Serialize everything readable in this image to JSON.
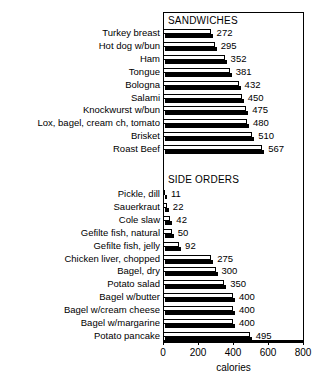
{
  "chart_data": {
    "type": "bar",
    "orientation": "horizontal",
    "title": "",
    "xlabel": "calories",
    "ylabel": "",
    "xlim": [
      0,
      800
    ],
    "xticks": [
      0,
      200,
      400,
      600,
      800
    ],
    "grid": false,
    "legend": null,
    "groups": [
      {
        "name": "SANDWICHES",
        "categories": [
          "Turkey breast",
          "Hot dog w/bun",
          "Ham",
          "Tongue",
          "Bologna",
          "Salami",
          "Knockwurst w/bun",
          "Lox, bagel, cream ch, tomato",
          "Brisket",
          "Roast Beef"
        ],
        "values": [
          272,
          295,
          352,
          381,
          432,
          450,
          475,
          480,
          510,
          567
        ]
      },
      {
        "name": "SIDE ORDERS",
        "categories": [
          "Pickle, dill",
          "Sauerkraut",
          "Cole slaw",
          "Gefilte fish, natural",
          "Gefilte fish, jelly",
          "Chicken liver, chopped",
          "Bagel, dry",
          "Potato salad",
          "Bagel w/butter",
          "Bagel w/cream cheese",
          "Bagel w/margarine",
          "Potato pancake"
        ],
        "values": [
          11,
          22,
          42,
          50,
          92,
          275,
          300,
          350,
          400,
          400,
          400,
          495
        ]
      }
    ],
    "colors": {
      "bar_face": "#ffffff",
      "bar_outline": "#000000",
      "bar_depth": "#000000",
      "text": "#000000",
      "background": "#ffffff"
    }
  }
}
